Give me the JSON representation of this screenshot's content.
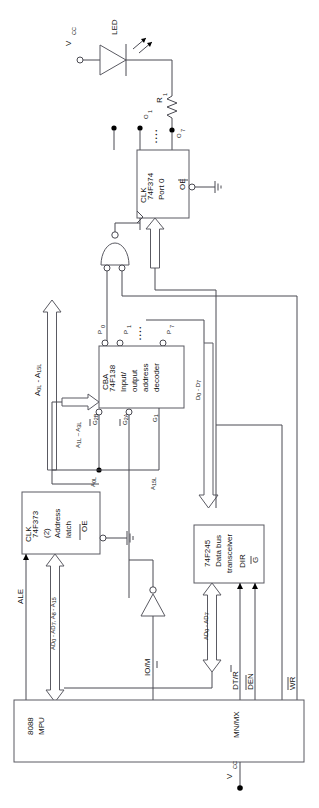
{
  "diagram": {
    "ink_color": "#4a4a52",
    "background": "#ffffff"
  },
  "power": {
    "vcc_top": "V",
    "vcc_top_sub": "CC",
    "vcc_bottom": "V",
    "vcc_bottom_sub": "CC"
  },
  "led": {
    "label": "LED",
    "resistor_label": "R",
    "resistor_sub": "1"
  },
  "port374": {
    "part": "74F374",
    "name": "Port 0",
    "clk": "CLK",
    "oe": "OE",
    "out_first": "O",
    "out_first_sub": "1",
    "out_last": "O",
    "out_last_sub": "7",
    "dots": "• • • •"
  },
  "decoder138": {
    "part": "74F138",
    "line2": "Input/",
    "line3": "output",
    "line4": "address",
    "line5": "decoder",
    "select_inputs": "CBA",
    "g2b": "G",
    "g2b_sub": "2B",
    "g2a": "G",
    "g2a_sub": "2A",
    "g1": "G",
    "g1_sub": "1",
    "p0": "P",
    "p0_sub": "0",
    "p1": "P",
    "p1_sub": "1",
    "p7": "P",
    "p7_sub": "7",
    "dots": "• • • •"
  },
  "latch373": {
    "part": "74F373",
    "qty": "(2)",
    "line3": "Address",
    "line4": "latch",
    "clk": "CLK",
    "oe": "OE"
  },
  "transceiver245": {
    "part": "74F245",
    "line2": "Data bus",
    "line3": "transceiver",
    "dir": "DIR",
    "g": "G"
  },
  "mpu": {
    "part": "8088",
    "line2": "MPU",
    "ale": "ALE",
    "iom": "IO/M",
    "dtr": "DT/R",
    "den": "DEN",
    "wr": "WR",
    "mnmx": "MN/MX"
  },
  "buses": {
    "addr_latched_full": "A",
    "addr_latched_full_sub1": "0L",
    "addr_latched_full_sub2": " - A",
    "addr_latched_full_sub3": "15L",
    "addr_decode_in": "A",
    "addr_decode_in_sub1": "1L",
    "addr_decode_in_sub2": " – A",
    "addr_decode_in_sub3": "3L",
    "a0l": "A",
    "a0l_sub": "0L",
    "a15l": "A",
    "a15l_sub": "15L",
    "data_bus": "D",
    "data_bus_sub1": "0",
    "data_bus_sub2": " - D",
    "data_bus_sub3": "7",
    "mux_bus": "AD",
    "mux_bus_sub1": "0",
    "mux_bus_sub2": " - AD",
    "mux_bus_sub3": "7",
    "addr_high_bus": "AD",
    "addr_high_bus_sub1": "0",
    "addr_high_bus_sub2": " - AD",
    "addr_high_bus_sub3": "7",
    "addr_high_bus_b": ", A",
    "addr_high_bus_sub4": "8",
    "addr_high_bus_b2": " - A",
    "addr_high_bus_sub5": "15"
  }
}
